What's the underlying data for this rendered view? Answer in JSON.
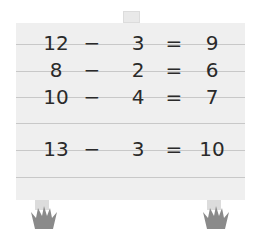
{
  "board": {
    "color": "#efefef",
    "line_color": "#c8c8c8",
    "equations": [
      {
        "a": "12",
        "op": "−",
        "b": "3",
        "eq": "=",
        "result": "9"
      },
      {
        "a": "8",
        "op": "−",
        "b": "2",
        "eq": "=",
        "result": "6"
      },
      {
        "a": "10",
        "op": "−",
        "b": "4",
        "eq": "=",
        "result": "7"
      },
      {
        "a": "13",
        "op": "−",
        "b": "3",
        "eq": "=",
        "result": "10"
      }
    ]
  },
  "decorations": {
    "grass_color": "#8a8a8a",
    "icons": [
      "grass-left-icon",
      "grass-right-icon"
    ]
  }
}
